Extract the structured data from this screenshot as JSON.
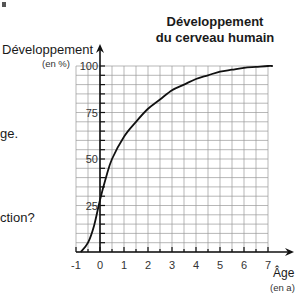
{
  "chart_data": {
    "type": "line",
    "title": "Développement du cerveau humain",
    "title_lines": [
      "Développement",
      "du cerveau humain"
    ],
    "ylabel": "Développement",
    "ylabel_unit": "(en %)",
    "xlabel": "Âge",
    "xlabel_unit": "(en a)",
    "xlim": [
      -1,
      7
    ],
    "ylim": [
      0,
      100
    ],
    "x_ticks": [
      "-1",
      "0",
      "1",
      "2",
      "3",
      "4",
      "5",
      "6",
      "7"
    ],
    "y_ticks": [
      "25",
      "50",
      "75",
      "100"
    ],
    "grid": true,
    "grid_x_step": 0.5,
    "grid_y_step": 5,
    "series": [
      {
        "name": "Développement du cerveau",
        "x": [
          -0.8,
          -0.5,
          -0.25,
          0,
          0.25,
          0.5,
          1,
          1.5,
          2,
          2.5,
          3,
          3.5,
          4,
          4.5,
          5,
          5.5,
          6,
          6.5,
          7,
          7.2
        ],
        "y": [
          0,
          5,
          14,
          28,
          40,
          50,
          62,
          70,
          77,
          82,
          87,
          90,
          93,
          95,
          97,
          98,
          99,
          99.5,
          100,
          100
        ]
      }
    ]
  },
  "fragments": {
    "left_text_1": "ge.",
    "left_text_2": "ction?"
  }
}
